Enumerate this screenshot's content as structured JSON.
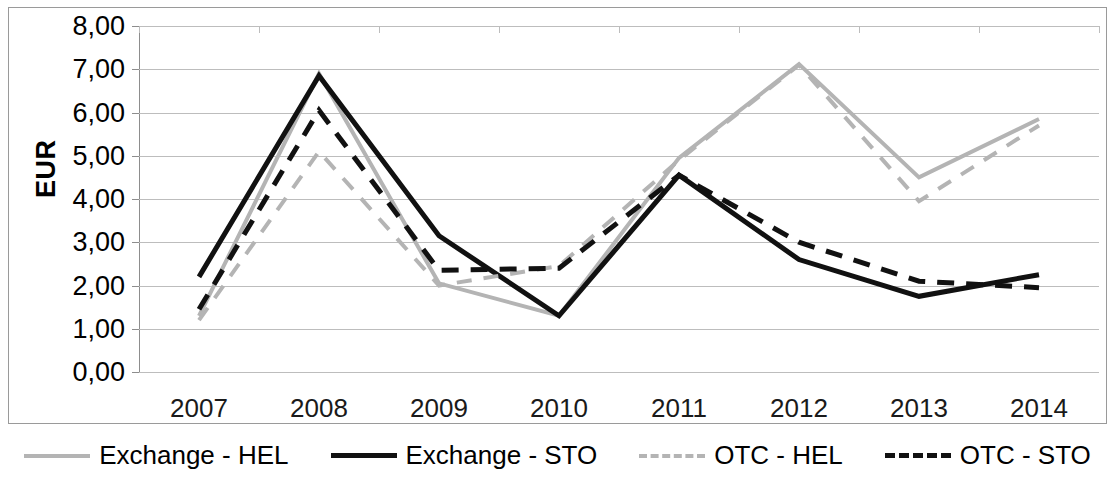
{
  "chart_data": {
    "type": "line",
    "title": "",
    "xlabel": "",
    "ylabel": "EUR",
    "x": [
      "2007",
      "2008",
      "2009",
      "2010",
      "2011",
      "2012",
      "2013",
      "2014"
    ],
    "categories": [
      "2007",
      "2008",
      "2009",
      "2010",
      "2011",
      "2012",
      "2013",
      "2014"
    ],
    "ylim": [
      0,
      8
    ],
    "ytick_labels": [
      "0,00",
      "1,00",
      "2,00",
      "3,00",
      "4,00",
      "5,00",
      "6,00",
      "7,00",
      "8,00"
    ],
    "ytick_values": [
      0,
      1,
      2,
      3,
      4,
      5,
      6,
      7,
      8
    ],
    "grid": true,
    "legend_position": "bottom",
    "series": [
      {
        "name": "Exchange - HEL",
        "color": "#b4b4b4",
        "style": "solid",
        "values": [
          1.3,
          6.9,
          2.05,
          1.3,
          4.95,
          7.12,
          4.5,
          5.85
        ]
      },
      {
        "name": "Exchange - STO",
        "color": "#111111",
        "style": "solid",
        "values": [
          2.2,
          6.85,
          3.15,
          1.3,
          4.55,
          2.6,
          1.75,
          2.25
        ]
      },
      {
        "name": "OTC - HEL",
        "color": "#b4b4b4",
        "style": "dashed",
        "values": [
          1.2,
          5.1,
          2.0,
          2.45,
          4.9,
          7.1,
          3.95,
          5.7
        ]
      },
      {
        "name": "OTC - STO",
        "color": "#111111",
        "style": "dashed",
        "values": [
          1.45,
          6.05,
          2.35,
          2.4,
          4.55,
          3.0,
          2.1,
          1.95
        ]
      }
    ]
  },
  "legend": {
    "items": [
      {
        "label": "Exchange - HEL"
      },
      {
        "label": "Exchange - STO"
      },
      {
        "label": "OTC - HEL"
      },
      {
        "label": "OTC - STO"
      }
    ]
  },
  "axes": {
    "y_title": "EUR",
    "y_labels": [
      "8,00",
      "7,00",
      "6,00",
      "5,00",
      "4,00",
      "3,00",
      "2,00",
      "1,00",
      "0,00"
    ],
    "x_labels": [
      "2007",
      "2008",
      "2009",
      "2010",
      "2011",
      "2012",
      "2013",
      "2014"
    ]
  }
}
